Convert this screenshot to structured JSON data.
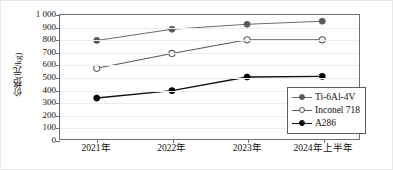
{
  "chart_data": {
    "type": "line",
    "title": "",
    "xlabel": "",
    "ylabel": "价格(元/kg)",
    "categories": [
      "2021年",
      "2022年",
      "2023年",
      "2024年上半年"
    ],
    "ylim": [
      0,
      1000
    ],
    "yticks": [
      "0",
      "100",
      "200",
      "300",
      "400",
      "500",
      "600",
      "700",
      "800",
      "900",
      "1 000"
    ],
    "ytick_values": [
      0,
      100,
      200,
      300,
      400,
      500,
      600,
      700,
      800,
      900,
      1000
    ],
    "grid": "horizontal",
    "legend_position": "bottom-right",
    "series": [
      {
        "name": "Ti-6Al-4V",
        "values": [
          795,
          885,
          925,
          950
        ],
        "marker": "filled-circle",
        "color": "#595959",
        "line_color": "#6b6b6b"
      },
      {
        "name": "Inconel 718",
        "values": [
          570,
          690,
          800,
          800
        ],
        "marker": "open-circle",
        "color": "#ffffff",
        "line_color": "#5a5a5a"
      },
      {
        "name": "A286",
        "values": [
          330,
          390,
          500,
          505
        ],
        "marker": "filled-circle",
        "color": "#000000",
        "line_color": "#111111"
      }
    ]
  },
  "legend": {
    "items": [
      {
        "label": "Ti-6Al-4V"
      },
      {
        "label": "Inconel 718"
      },
      {
        "label": "A286"
      }
    ]
  }
}
